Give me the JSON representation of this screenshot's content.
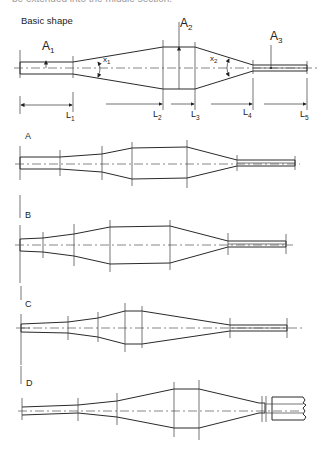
{
  "page": {
    "cut_off_text": "be extended into the middle section."
  },
  "basic_shape": {
    "title": "Basic shape",
    "area_labels": {
      "a1": "A",
      "a1_sub": "1",
      "a2": "A",
      "a2_sub": "2",
      "a3": "A",
      "a3_sub": "3"
    },
    "angle_labels": {
      "x1": "x",
      "x1_sub": "1",
      "x2": "x",
      "x2_sub": "2"
    },
    "length_labels": [
      {
        "main": "L",
        "sub": "1"
      },
      {
        "main": "L",
        "sub": "2"
      },
      {
        "main": "L",
        "sub": "3"
      },
      {
        "main": "L",
        "sub": "4"
      },
      {
        "main": "L",
        "sub": "5"
      }
    ]
  },
  "variants": [
    {
      "label": "A"
    },
    {
      "label": "B"
    },
    {
      "label": "C"
    },
    {
      "label": "D"
    }
  ],
  "colors": {
    "line": "#2a2a2a",
    "background": "#ffffff"
  }
}
